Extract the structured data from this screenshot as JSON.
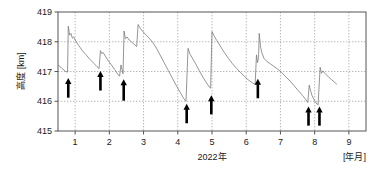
{
  "chart_data": {
    "type": "line",
    "title": "",
    "subtitle": "",
    "xlabel": "2022年",
    "xunit": "[年月]",
    "ylabel": "高度 [km]",
    "yunit": "km",
    "xlim": [
      0.5,
      9.5
    ],
    "ylim": [
      415,
      419
    ],
    "xticks": [
      1,
      2,
      3,
      4,
      5,
      6,
      7,
      8,
      9
    ],
    "xtick_labels": [
      "1",
      "2",
      "3",
      "4",
      "5",
      "6",
      "7",
      "8",
      "9"
    ],
    "yticks": [
      415,
      416,
      417,
      418,
      419
    ],
    "ytick_labels": [
      "415",
      "416",
      "417",
      "418",
      "419"
    ],
    "grid": true,
    "grid_style": "dotted",
    "legend": null,
    "line_color": "#7a7a7a",
    "axis_color": "#555555",
    "annotation_color": "#000000",
    "series": [
      {
        "name": "軌道高度",
        "points": [
          [
            0.52,
            417.2
          ],
          [
            0.62,
            417.1
          ],
          [
            0.72,
            417.0
          ],
          [
            0.78,
            416.98
          ],
          [
            0.8,
            418.52
          ],
          [
            0.84,
            418.22
          ],
          [
            0.88,
            418.28
          ],
          [
            0.92,
            418.12
          ],
          [
            0.96,
            418.16
          ],
          [
            1.02,
            418.02
          ],
          [
            1.1,
            417.88
          ],
          [
            1.2,
            417.72
          ],
          [
            1.32,
            417.56
          ],
          [
            1.44,
            417.4
          ],
          [
            1.56,
            417.26
          ],
          [
            1.64,
            417.16
          ],
          [
            1.7,
            417.1
          ],
          [
            1.74,
            417.7
          ],
          [
            1.78,
            417.6
          ],
          [
            1.82,
            417.64
          ],
          [
            1.88,
            417.52
          ],
          [
            1.96,
            417.38
          ],
          [
            2.06,
            417.22
          ],
          [
            2.16,
            417.06
          ],
          [
            2.24,
            416.92
          ],
          [
            2.3,
            416.84
          ],
          [
            2.34,
            417.22
          ],
          [
            2.38,
            417.02
          ],
          [
            2.4,
            416.92
          ],
          [
            2.43,
            418.36
          ],
          [
            2.47,
            418.1
          ],
          [
            2.52,
            418.16
          ],
          [
            2.58,
            418.06
          ],
          [
            2.66,
            417.98
          ],
          [
            2.74,
            417.9
          ],
          [
            2.8,
            417.84
          ],
          [
            2.84,
            418.58
          ],
          [
            2.9,
            418.46
          ],
          [
            2.98,
            418.34
          ],
          [
            3.08,
            418.22
          ],
          [
            3.18,
            418.1
          ],
          [
            3.28,
            417.96
          ],
          [
            3.38,
            417.78
          ],
          [
            3.48,
            417.56
          ],
          [
            3.6,
            417.3
          ],
          [
            3.72,
            417.04
          ],
          [
            3.84,
            416.78
          ],
          [
            3.96,
            416.52
          ],
          [
            4.08,
            416.28
          ],
          [
            4.18,
            416.08
          ],
          [
            4.24,
            416.0
          ],
          [
            4.3,
            417.78
          ],
          [
            4.36,
            417.58
          ],
          [
            4.44,
            417.42
          ],
          [
            4.54,
            417.22
          ],
          [
            4.64,
            417.0
          ],
          [
            4.74,
            416.8
          ],
          [
            4.84,
            416.62
          ],
          [
            4.92,
            416.48
          ],
          [
            4.96,
            416.44
          ],
          [
            5.0,
            418.34
          ],
          [
            5.06,
            418.2
          ],
          [
            5.14,
            418.04
          ],
          [
            5.24,
            417.86
          ],
          [
            5.36,
            417.64
          ],
          [
            5.48,
            417.44
          ],
          [
            5.6,
            417.26
          ],
          [
            5.72,
            417.1
          ],
          [
            5.84,
            416.96
          ],
          [
            5.96,
            416.82
          ],
          [
            6.08,
            416.7
          ],
          [
            6.18,
            416.62
          ],
          [
            6.26,
            416.56
          ],
          [
            6.3,
            417.56
          ],
          [
            6.33,
            417.3
          ],
          [
            6.36,
            417.48
          ],
          [
            6.38,
            418.28
          ],
          [
            6.42,
            417.82
          ],
          [
            6.46,
            417.62
          ],
          [
            6.52,
            417.44
          ],
          [
            6.6,
            417.34
          ],
          [
            6.7,
            417.26
          ],
          [
            6.8,
            417.18
          ],
          [
            6.92,
            417.08
          ],
          [
            7.04,
            416.96
          ],
          [
            7.16,
            416.82
          ],
          [
            7.28,
            416.68
          ],
          [
            7.4,
            416.52
          ],
          [
            7.52,
            416.36
          ],
          [
            7.64,
            416.2
          ],
          [
            7.74,
            416.06
          ],
          [
            7.8,
            415.96
          ],
          [
            7.84,
            416.54
          ],
          [
            7.88,
            416.36
          ],
          [
            7.92,
            416.2
          ],
          [
            7.98,
            416.06
          ],
          [
            8.04,
            415.94
          ],
          [
            8.1,
            415.88
          ],
          [
            8.16,
            417.14
          ],
          [
            8.2,
            416.94
          ],
          [
            8.24,
            417.02
          ],
          [
            8.3,
            416.94
          ],
          [
            8.4,
            416.82
          ],
          [
            8.5,
            416.72
          ],
          [
            8.58,
            416.64
          ],
          [
            8.64,
            416.58
          ]
        ]
      }
    ],
    "annotations": [
      {
        "type": "arrow",
        "label": "reboost",
        "x": 0.8,
        "y_tip": 416.78,
        "y_tail": 416.12
      },
      {
        "type": "arrow",
        "label": "reboost",
        "x": 1.74,
        "y_tip": 417.02,
        "y_tail": 416.36
      },
      {
        "type": "arrow",
        "label": "reboost",
        "x": 2.42,
        "y_tip": 416.74,
        "y_tail": 416.02
      },
      {
        "type": "arrow",
        "label": "reboost",
        "x": 4.26,
        "y_tip": 415.92,
        "y_tail": 415.26
      },
      {
        "type": "arrow",
        "label": "reboost",
        "x": 4.98,
        "y_tip": 416.2,
        "y_tail": 415.56
      },
      {
        "type": "arrow",
        "label": "reboost",
        "x": 6.34,
        "y_tip": 416.76,
        "y_tail": 416.1
      },
      {
        "type": "arrow",
        "label": "reboost",
        "x": 7.82,
        "y_tip": 415.82,
        "y_tail": 415.18
      },
      {
        "type": "arrow",
        "label": "reboost",
        "x": 8.14,
        "y_tip": 415.82,
        "y_tail": 415.18
      }
    ]
  }
}
